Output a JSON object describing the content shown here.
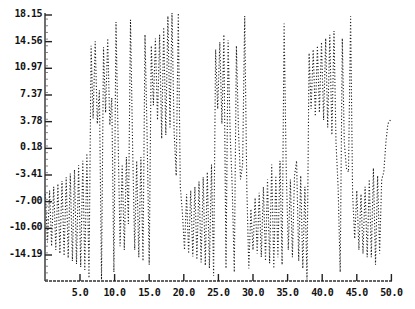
{
  "chart_data": {
    "type": "line",
    "title": "",
    "xlabel": "",
    "ylabel": "",
    "xlim": [
      0,
      50
    ],
    "ylim": [
      -17.8,
      18.4
    ],
    "grid": false,
    "legend": null,
    "line_style": "dotted",
    "x_ticks": [
      "5.0",
      "10.0",
      "15.0",
      "20.0",
      "25.0",
      "30.0",
      "35.0",
      "40.0",
      "45.0",
      "50.0"
    ],
    "x_tick_values": [
      5,
      10,
      15,
      20,
      25,
      30,
      35,
      40,
      45,
      50
    ],
    "y_ticks": [
      "18.15",
      "14.56",
      "10.97",
      "7.37",
      "3.78",
      "0.18",
      "-3.41",
      "-7.00",
      "-10.60",
      "-14.19"
    ],
    "y_tick_values": [
      18.15,
      14.56,
      10.97,
      7.37,
      3.78,
      0.18,
      -3.41,
      -7.0,
      -10.6,
      -14.19
    ],
    "series": [
      {
        "name": "signal",
        "color": "#222222",
        "points": [
          [
            0.0,
            -6.0
          ],
          [
            0.3,
            -12.5
          ],
          [
            0.6,
            -5.5
          ],
          [
            0.9,
            -13.0
          ],
          [
            1.2,
            -5.0
          ],
          [
            1.5,
            -13.5
          ],
          [
            1.8,
            -4.6
          ],
          [
            2.1,
            -14.0
          ],
          [
            2.4,
            -4.2
          ],
          [
            2.7,
            -14.3
          ],
          [
            3.0,
            -3.7
          ],
          [
            3.3,
            -14.6
          ],
          [
            3.6,
            -3.2
          ],
          [
            3.9,
            -15.0
          ],
          [
            4.2,
            -2.7
          ],
          [
            4.5,
            -15.4
          ],
          [
            4.8,
            -2.1
          ],
          [
            5.1,
            -15.8
          ],
          [
            5.4,
            -1.5
          ],
          [
            5.7,
            -16.2
          ],
          [
            6.0,
            -0.5
          ],
          [
            6.3,
            -17.3
          ],
          [
            6.6,
            14.0
          ],
          [
            6.9,
            4.2
          ],
          [
            7.2,
            14.6
          ],
          [
            7.5,
            3.5
          ],
          [
            7.8,
            8.0
          ],
          [
            8.1,
            -17.5
          ],
          [
            8.4,
            13.8
          ],
          [
            8.7,
            5.0
          ],
          [
            9.0,
            15.0
          ],
          [
            9.3,
            3.3
          ],
          [
            9.6,
            7.0
          ],
          [
            9.9,
            -16.5
          ],
          [
            10.2,
            17.2
          ],
          [
            10.5,
            1.5
          ],
          [
            10.8,
            -13.0
          ],
          [
            11.1,
            -2.0
          ],
          [
            11.4,
            -13.5
          ],
          [
            11.7,
            -1.0
          ],
          [
            12.0,
            -10.0
          ],
          [
            12.3,
            17.5
          ],
          [
            12.6,
            0.5
          ],
          [
            12.9,
            -13.5
          ],
          [
            13.2,
            -1.5
          ],
          [
            13.5,
            -14.5
          ],
          [
            13.8,
            -1.0
          ],
          [
            14.1,
            -15.0
          ],
          [
            14.4,
            15.5
          ],
          [
            14.7,
            2.0
          ],
          [
            15.0,
            -15.5
          ],
          [
            15.3,
            14.0
          ],
          [
            15.6,
            6.0
          ],
          [
            15.9,
            15.0
          ],
          [
            16.2,
            4.0
          ],
          [
            16.5,
            15.5
          ],
          [
            16.8,
            1.5
          ],
          [
            17.1,
            16.5
          ],
          [
            17.4,
            2.0
          ],
          [
            17.7,
            18.0
          ],
          [
            18.0,
            3.0
          ],
          [
            18.3,
            18.4
          ],
          [
            18.6,
            2.5
          ],
          [
            18.9,
            -3.5
          ],
          [
            19.2,
            18.4
          ],
          [
            19.5,
            -5.0
          ],
          [
            19.8,
            -8.5
          ],
          [
            20.1,
            -13.5
          ],
          [
            20.4,
            -6.0
          ],
          [
            20.7,
            -14.0
          ],
          [
            21.0,
            -5.5
          ],
          [
            21.3,
            -14.4
          ],
          [
            21.6,
            -5.0
          ],
          [
            21.9,
            -14.8
          ],
          [
            22.2,
            -4.3
          ],
          [
            22.5,
            -15.2
          ],
          [
            22.8,
            -3.7
          ],
          [
            23.1,
            -15.6
          ],
          [
            23.4,
            -3.0
          ],
          [
            23.7,
            -16.0
          ],
          [
            24.0,
            -2.0
          ],
          [
            24.3,
            -17.0
          ],
          [
            24.6,
            13.5
          ],
          [
            24.9,
            5.5
          ],
          [
            25.2,
            14.5
          ],
          [
            25.5,
            3.5
          ],
          [
            25.8,
            15.5
          ],
          [
            26.1,
            -16.0
          ],
          [
            26.4,
            14.8
          ],
          [
            26.7,
            2.0
          ],
          [
            27.0,
            -5.0
          ],
          [
            27.3,
            -16.5
          ],
          [
            27.6,
            14.0
          ],
          [
            27.9,
            2.5
          ],
          [
            28.2,
            -4.0
          ],
          [
            28.5,
            -2.0
          ],
          [
            28.8,
            18.0
          ],
          [
            29.1,
            -5.0
          ],
          [
            29.4,
            -16.0
          ],
          [
            29.7,
            -8.0
          ],
          [
            30.0,
            -13.5
          ],
          [
            30.3,
            -6.5
          ],
          [
            30.6,
            -14.0
          ],
          [
            30.9,
            -5.8
          ],
          [
            31.2,
            -14.5
          ],
          [
            31.5,
            -5.0
          ],
          [
            31.8,
            -15.0
          ],
          [
            32.1,
            -4.0
          ],
          [
            32.4,
            -15.3
          ],
          [
            32.7,
            -2.0
          ],
          [
            33.0,
            -16.0
          ],
          [
            33.3,
            -3.5
          ],
          [
            33.6,
            -14.5
          ],
          [
            33.9,
            -1.5
          ],
          [
            34.2,
            -15.5
          ],
          [
            34.5,
            17.0
          ],
          [
            34.8,
            -2.5
          ],
          [
            35.1,
            -13.5
          ],
          [
            35.4,
            -4.0
          ],
          [
            35.7,
            -14.5
          ],
          [
            36.0,
            -3.5
          ],
          [
            36.3,
            -1.5
          ],
          [
            36.6,
            -15.0
          ],
          [
            36.9,
            -3.5
          ],
          [
            37.2,
            -16.0
          ],
          [
            37.5,
            -5.0
          ],
          [
            37.8,
            -17.5
          ],
          [
            38.1,
            13.0
          ],
          [
            38.4,
            5.5
          ],
          [
            38.7,
            13.5
          ],
          [
            39.0,
            4.5
          ],
          [
            39.3,
            14.0
          ],
          [
            39.6,
            5.0
          ],
          [
            39.9,
            14.5
          ],
          [
            40.2,
            4.0
          ],
          [
            40.5,
            15.0
          ],
          [
            40.8,
            3.0
          ],
          [
            41.1,
            15.5
          ],
          [
            41.4,
            2.0
          ],
          [
            41.7,
            16.0
          ],
          [
            42.0,
            1.0
          ],
          [
            42.3,
            -5.0
          ],
          [
            42.6,
            -16.5
          ],
          [
            42.9,
            15.0
          ],
          [
            43.2,
            1.0
          ],
          [
            43.5,
            -2.5
          ],
          [
            43.8,
            -3.0
          ],
          [
            44.1,
            18.0
          ],
          [
            44.4,
            -6.0
          ],
          [
            44.7,
            -12.0
          ],
          [
            45.0,
            -5.5
          ],
          [
            45.3,
            -13.5
          ],
          [
            45.6,
            -6.0
          ],
          [
            45.9,
            -14.0
          ],
          [
            46.2,
            -5.0
          ],
          [
            46.5,
            -14.5
          ],
          [
            46.8,
            -4.0
          ],
          [
            47.1,
            -14.5
          ],
          [
            47.4,
            -2.5
          ],
          [
            47.7,
            -15.5
          ],
          [
            48.0,
            -3.5
          ],
          [
            48.3,
            -14.0
          ],
          [
            48.6,
            -4.0
          ],
          [
            48.9,
            -3.0
          ],
          [
            49.2,
            1.0
          ],
          [
            49.5,
            3.5
          ],
          [
            50.0,
            4.2
          ]
        ]
      }
    ]
  }
}
